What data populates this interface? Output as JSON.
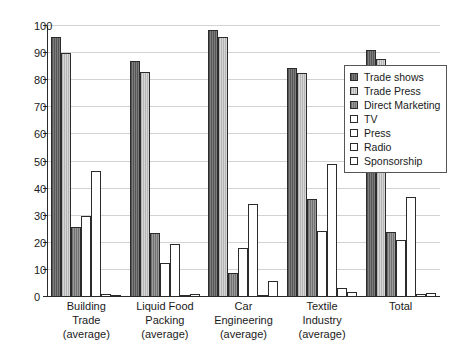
{
  "chart_data": {
    "type": "bar",
    "title": "",
    "subtitle": "",
    "xlabel": "",
    "ylabel": "",
    "ylim": [
      0,
      100
    ],
    "y_ticks": [
      0,
      10,
      20,
      30,
      40,
      50,
      60,
      70,
      80,
      90,
      100
    ],
    "grid": true,
    "legend_position": "upper-right",
    "orientation": "vertical",
    "grouping": "clustered",
    "categories": [
      "Building Trade (average)",
      "Liquid Food Packing (average)",
      "Car Engineering (average)",
      "Textile Industry (average)",
      "Total"
    ],
    "category_label_lines": [
      [
        "Building",
        "Trade",
        "(average)"
      ],
      [
        "Liquid Food",
        "Packing",
        "(average)"
      ],
      [
        "Car",
        "Engineering",
        "(average)"
      ],
      [
        "Textile",
        "Industry",
        "(average)"
      ],
      [
        "Total"
      ]
    ],
    "series": [
      {
        "name": "Trade shows",
        "color": "#6b6b6b",
        "values": [
          96,
          87,
          98.5,
          84.5,
          91
        ]
      },
      {
        "name": "Trade Press",
        "color": "#c9c9c9",
        "values": [
          90,
          83,
          96,
          82.5,
          88
        ]
      },
      {
        "name": "Direct Marketing",
        "color": "#8a8a8a",
        "values": [
          26,
          23.5,
          9,
          36,
          24
        ]
      },
      {
        "name": "TV",
        "color": "#ffffff",
        "values": [
          30,
          12.5,
          18,
          24.5,
          21
        ]
      },
      {
        "name": "Press",
        "color": "#ffffff",
        "values": [
          46.5,
          19.5,
          34.5,
          49,
          37
        ]
      },
      {
        "name": "Radio",
        "color": "#ffffff",
        "values": [
          1,
          0.5,
          0.5,
          3.5,
          1
        ]
      },
      {
        "name": "Sponsorship",
        "color": "#ffffff",
        "values": [
          0.5,
          1,
          6,
          2,
          1.5
        ]
      }
    ]
  },
  "legend": {
    "items": [
      {
        "label": "Trade shows"
      },
      {
        "label": "Trade Press"
      },
      {
        "label": "Direct Marketing"
      },
      {
        "label": "TV"
      },
      {
        "label": "Press"
      },
      {
        "label": "Radio"
      },
      {
        "label": "Sponsorship"
      }
    ]
  },
  "colors": {
    "axis": "#2b2b2b",
    "grid": "#d2d2d2",
    "text": "#1a1a1a",
    "background": "#ffffff"
  }
}
